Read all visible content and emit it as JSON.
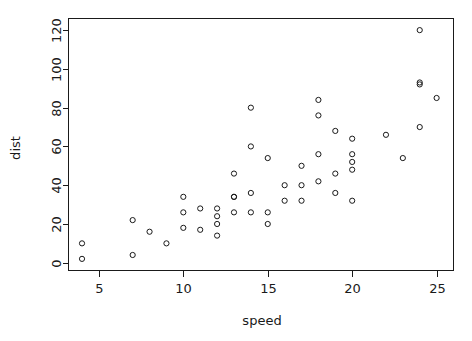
{
  "chart_data": {
    "type": "scatter",
    "title": "",
    "xlabel": "speed",
    "ylabel": "dist",
    "xlim": [
      3.2,
      26.0
    ],
    "ylim": [
      -4.0,
      126.0
    ],
    "xticks": [
      5,
      10,
      15,
      20,
      25
    ],
    "yticks": [
      0,
      20,
      40,
      60,
      80,
      100,
      120
    ],
    "xtick_labels": [
      "5",
      "10",
      "15",
      "20",
      "25"
    ],
    "ytick_labels": [
      "0",
      "20",
      "40",
      "60",
      "80",
      "100",
      "120"
    ],
    "grid": false,
    "legend": null,
    "marker": "open-circle",
    "marker_color": "#1a1a1a",
    "marker_radius": 2.6,
    "x": [
      4,
      4,
      7,
      7,
      8,
      9,
      10,
      10,
      10,
      11,
      11,
      12,
      12,
      12,
      12,
      13,
      13,
      13,
      13,
      14,
      14,
      14,
      14,
      15,
      15,
      15,
      16,
      16,
      17,
      17,
      17,
      18,
      18,
      18,
      18,
      19,
      19,
      19,
      20,
      20,
      20,
      20,
      20,
      22,
      23,
      24,
      24,
      24,
      24,
      25
    ],
    "y": [
      2,
      10,
      4,
      22,
      16,
      10,
      18,
      26,
      34,
      17,
      28,
      14,
      20,
      24,
      28,
      26,
      34,
      34,
      46,
      26,
      36,
      60,
      80,
      20,
      26,
      54,
      32,
      40,
      32,
      40,
      50,
      42,
      56,
      76,
      84,
      36,
      46,
      68,
      32,
      48,
      52,
      56,
      64,
      66,
      54,
      70,
      92,
      93,
      120,
      85
    ]
  },
  "axis": {
    "x_title": "speed",
    "y_title": "dist"
  }
}
